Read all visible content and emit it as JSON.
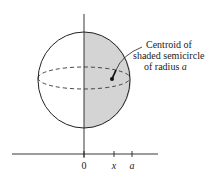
{
  "diagram": {
    "annotation": {
      "lines": [
        "Centroid of",
        "shaded semicircle",
        "of radius a"
      ],
      "line1": "Centroid of",
      "line2": "shaded semicircle",
      "line3_prefix": "of radius ",
      "line3_var": "a"
    },
    "axis": {
      "ticks": [
        {
          "label": "0",
          "italic": false
        },
        {
          "label": "x",
          "italic": true
        },
        {
          "label": "a",
          "italic": true
        }
      ]
    },
    "colors": {
      "shade": "#d4d4d4",
      "stroke": "#222222",
      "background": "#ffffff"
    }
  }
}
